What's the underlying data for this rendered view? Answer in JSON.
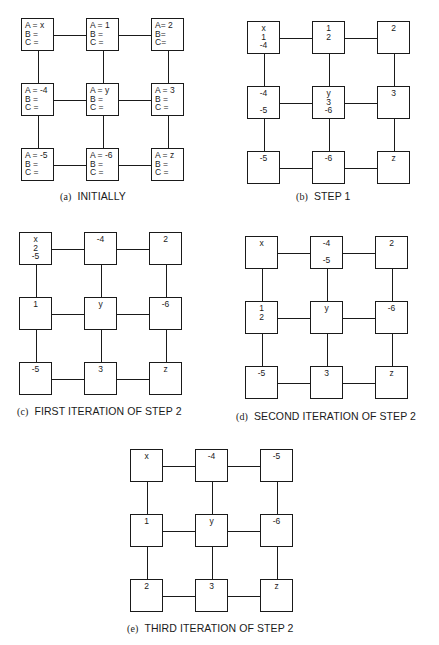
{
  "panels": [
    {
      "id": "a",
      "tag": "(a)",
      "caption": "INITIALLY",
      "origin": [
        21,
        18
      ],
      "caption_pos": [
        60,
        190
      ],
      "labeled": true,
      "nodes": [
        [
          "A = x\nB =\nC =",
          "A = 1\nB =\nC =",
          "A= 2\nB=\nC="
        ],
        [
          "A = -4\nB =\nC =",
          "A = y\nB =\nC =",
          "A = 3\nB =\nC ="
        ],
        [
          "A = -5\nB =\nC =",
          "A = -6\nB =\nC =",
          "A = z\nB =\nC ="
        ]
      ]
    },
    {
      "id": "b",
      "tag": "(b)",
      "caption": "STEP 1",
      "origin": [
        247,
        21
      ],
      "caption_pos": [
        296,
        190
      ],
      "labeled": false,
      "nodes": [
        [
          "x\n1\n-4",
          "1\n2",
          "2"
        ],
        [
          "-4\n\n-5",
          "y\n3\n-6",
          "3"
        ],
        [
          "-5",
          "-6",
          "z"
        ]
      ]
    },
    {
      "id": "c",
      "tag": "(c)",
      "caption": "FIRST ITERATION OF STEP 2",
      "origin": [
        19,
        232
      ],
      "caption_pos": [
        17,
        405
      ],
      "labeled": false,
      "nodes": [
        [
          "x\n2\n-5",
          "-4",
          "2"
        ],
        [
          "1",
          "y",
          "-6"
        ],
        [
          "-5",
          "3",
          "z"
        ]
      ]
    },
    {
      "id": "d",
      "tag": "(d)",
      "caption": "SECOND ITERATION OF STEP 2",
      "origin": [
        245,
        236
      ],
      "caption_pos": [
        236,
        410
      ],
      "labeled": false,
      "nodes": [
        [
          "x",
          "-4\n\n-5",
          "2"
        ],
        [
          "1\n2",
          "y",
          "-6"
        ],
        [
          "-5",
          "3",
          "z"
        ]
      ]
    },
    {
      "id": "e",
      "tag": "(e)",
      "caption": "THIRD ITERATION OF STEP 2",
      "origin": [
        130,
        449
      ],
      "caption_pos": [
        127,
        622
      ],
      "labeled": false,
      "nodes": [
        [
          "x",
          "-4",
          "-5"
        ],
        [
          "1",
          "y",
          "-6"
        ],
        [
          "2",
          "3",
          "z"
        ]
      ]
    }
  ],
  "layout": {
    "spacing": 65,
    "box": 33
  }
}
